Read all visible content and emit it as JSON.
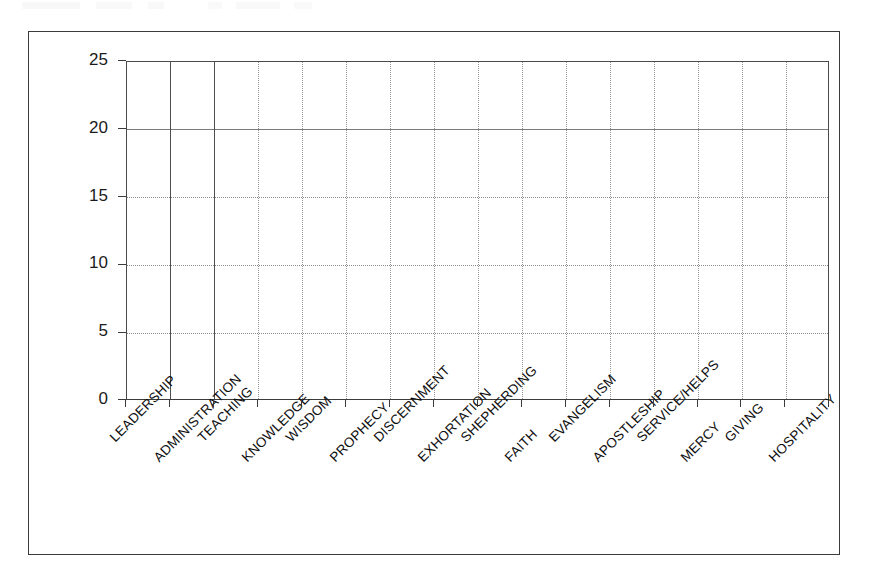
{
  "chart_data": {
    "type": "bar",
    "title": "",
    "subtitle": "",
    "xlabel": "",
    "ylabel": "",
    "categories": [
      "LEADERSHIP",
      "ADMINISTRATION",
      "TEACHING",
      "KNOWLEDGE",
      "WISDOM",
      "PROPHECY",
      "DISCERNMENT",
      "EXHORTATION",
      "SHEPHERDING",
      "FAITH",
      "EVANGELISM",
      "APOSTLESHIP",
      "SERVICE/HELPS",
      "MERCY",
      "GIVING",
      "HOSPITALITY"
    ],
    "values": [
      0,
      0,
      0,
      0,
      0,
      0,
      0,
      0,
      0,
      0,
      0,
      0,
      0,
      0,
      0,
      0
    ],
    "ylim": [
      0,
      25
    ],
    "ytick_labels": [
      "25",
      "20",
      "15",
      "10",
      "5",
      "0"
    ],
    "ytick_values": [
      25,
      20,
      15,
      10,
      5,
      0
    ],
    "grid": true,
    "grid_axes": "both",
    "legend": false,
    "legend_position": "none",
    "bars_drawn": false,
    "label_rotation_deg": -45,
    "colors": {
      "background": "#ffffff",
      "frame": "#3a3a3a",
      "axis": "#3b3b3b",
      "gridline_major": "#7b7b7b",
      "gridline_minor": "#9a9a9a",
      "text": "#101010"
    }
  },
  "axes": {
    "y": {
      "ticks": [
        {
          "label": "25",
          "value": 25
        },
        {
          "label": "20",
          "value": 20
        },
        {
          "label": "15",
          "value": 15
        },
        {
          "label": "10",
          "value": 10
        },
        {
          "label": "5",
          "value": 5
        },
        {
          "label": "0",
          "value": 0
        }
      ]
    }
  }
}
